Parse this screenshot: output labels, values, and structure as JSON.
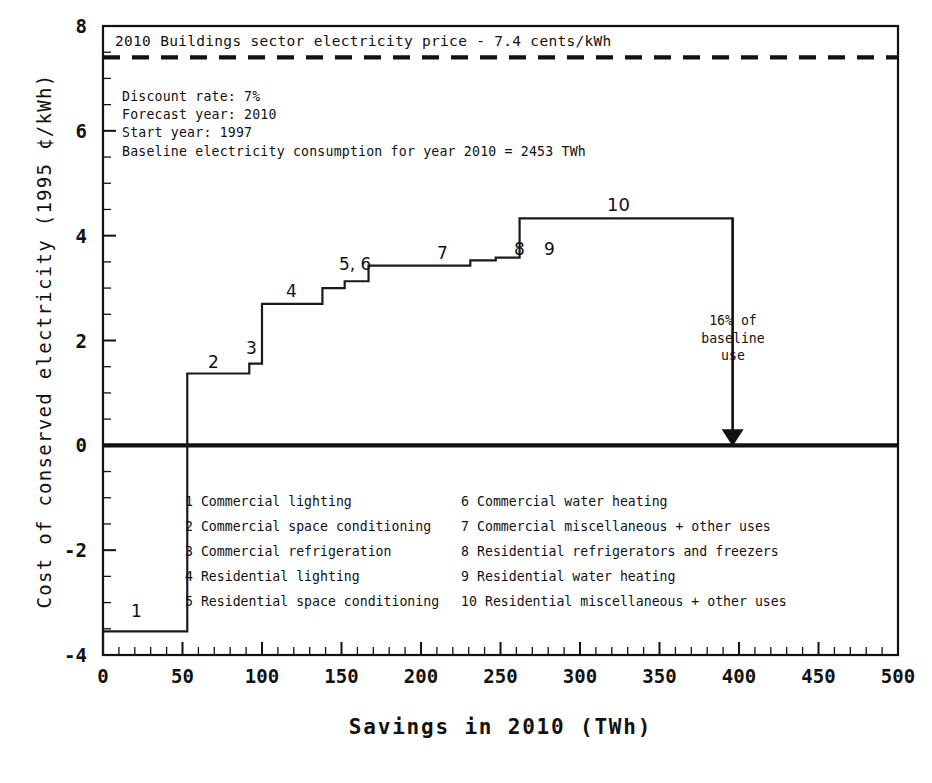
{
  "chart_data": {
    "type": "line",
    "subtype": "step-supply-curve",
    "title": "",
    "xlabel": "Savings in 2010  (TWh)",
    "ylabel": "Cost of conserved electricity  (1995 ¢/kWh)",
    "xlim": [
      0,
      500
    ],
    "ylim": [
      -4,
      8
    ],
    "xticks": [
      0,
      50,
      100,
      150,
      200,
      250,
      300,
      350,
      400,
      450,
      500
    ],
    "yticks": [
      -4,
      -2,
      0,
      2,
      4,
      6,
      8
    ],
    "x_minor_step": 10,
    "y_minor_step": 0.5,
    "grid": false,
    "legend_position": "inside-bottom",
    "steps": [
      {
        "id": 1,
        "label": "Commercial lighting",
        "x_start": 0,
        "x_end": 53,
        "cost": -3.55
      },
      {
        "id": 2,
        "label": "Commercial space conditioning",
        "x_start": 53,
        "x_end": 92,
        "cost": 1.37
      },
      {
        "id": 3,
        "label": "Commercial refrigeration",
        "x_start": 92,
        "x_end": 100,
        "cost": 1.56
      },
      {
        "id": 4,
        "label": "Residential lighting",
        "x_start": 100,
        "x_end": 138,
        "cost": 2.7
      },
      {
        "id": 5,
        "label": "Residential space conditioning",
        "x_start": 138,
        "x_end": 152,
        "cost": 3.0
      },
      {
        "id": 6,
        "label": "Commercial water heating",
        "x_start": 152,
        "x_end": 167,
        "cost": 3.13
      },
      {
        "id": 7,
        "label": "Commercial miscellaneous + other uses",
        "x_start": 167,
        "x_end": 231,
        "cost": 3.43
      },
      {
        "id": 8,
        "label": "Residential refrigerators and freezers",
        "x_start": 231,
        "x_end": 247,
        "cost": 3.53
      },
      {
        "id": 9,
        "label": "Residential water heating",
        "x_start": 247,
        "x_end": 262,
        "cost": 3.58
      },
      {
        "id": 10,
        "label": "Residential miscellaneous + other uses",
        "x_start": 262,
        "x_end": 396,
        "cost": 4.33
      }
    ],
    "step_number_labels": [
      "1",
      "2",
      "3",
      "4",
      "5, 6",
      "7",
      "8",
      "9",
      "10"
    ],
    "reference_line": {
      "value": 7.4,
      "style": "dashed",
      "label": "2010 Buildings sector electricity price - 7.4 cents/kWh"
    },
    "annotations": {
      "parameters": [
        "Discount rate: 7%",
        "Forecast year: 2010",
        "Start year: 1997",
        "Baseline electricity consumption for year 2010 = 2453 TWh"
      ],
      "arrow_note": [
        "16% of",
        "baseline",
        "use"
      ],
      "arrow_x": 396
    },
    "legend_left": [
      {
        "num": "1",
        "text": "Commercial lighting"
      },
      {
        "num": "2",
        "text": "Commercial space conditioning"
      },
      {
        "num": "3",
        "text": "Commercial refrigeration"
      },
      {
        "num": "4",
        "text": "Residential lighting"
      },
      {
        "num": "5",
        "text": "Residential space conditioning"
      }
    ],
    "legend_right": [
      {
        "num": "6",
        "text": "Commercial water heating"
      },
      {
        "num": "7",
        "text": "Commercial miscellaneous + other uses"
      },
      {
        "num": "8",
        "text": "Residential refrigerators and freezers"
      },
      {
        "num": "9",
        "text": "Residential water heating"
      },
      {
        "num": "10",
        "text": "Residential miscellaneous + other uses"
      }
    ],
    "colors": {
      "line": "#1a1a1a",
      "axis": "#111111",
      "background": "#ffffff"
    }
  },
  "axis": {
    "x_tick_labels": [
      "0",
      "50",
      "100",
      "150",
      "200",
      "250",
      "300",
      "350",
      "400",
      "450",
      "500"
    ],
    "y_tick_labels": [
      "8",
      "6",
      "4",
      "2",
      "0",
      "-2",
      "-4"
    ],
    "x_title": "Savings in 2010  (TWh)",
    "y_title": "Cost of conserved electricity  (1995 ¢/kWh)"
  },
  "step_labels": {
    "n1": "1",
    "n2": "2",
    "n3": "3",
    "n4": "4",
    "n56": "5, 6",
    "n7": "7",
    "n8": "8",
    "n9": "9",
    "n10": "10"
  },
  "price_line": {
    "caption": "2010 Buildings sector electricity price - 7.4 cents/kWh"
  },
  "params": {
    "l1": "Discount rate: 7%",
    "l2": "Forecast year: 2010",
    "l3": "Start year: 1997",
    "l4": "Baseline electricity consumption for year 2010 = 2453 TWh"
  },
  "arrow_note": {
    "l1": "16% of",
    "l2": "baseline",
    "l3": "use"
  },
  "legend": {
    "left": [
      {
        "num": "1",
        "text": "Commercial lighting"
      },
      {
        "num": "2",
        "text": "Commercial space conditioning"
      },
      {
        "num": "3",
        "text": "Commercial refrigeration"
      },
      {
        "num": "4",
        "text": "Residential lighting"
      },
      {
        "num": "5",
        "text": "Residential space conditioning"
      }
    ],
    "right": [
      {
        "num": "6",
        "text": "Commercial water heating"
      },
      {
        "num": "7",
        "text": "Commercial miscellaneous + other uses"
      },
      {
        "num": "8",
        "text": "Residential refrigerators and freezers"
      },
      {
        "num": "9",
        "text": "Residential water heating"
      },
      {
        "num": "10",
        "text": "Residential miscellaneous + other uses"
      }
    ]
  }
}
